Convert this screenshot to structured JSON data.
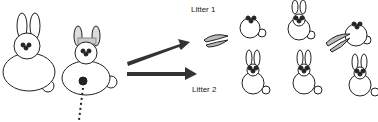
{
  "diagram": {
    "labels": {
      "litter1": "Litter 1",
      "litter2": "Litter 2"
    },
    "parents": [
      {
        "id": "father",
        "accessory": "none"
      },
      {
        "id": "mother",
        "accessory": "bow",
        "marking": "spot"
      }
    ],
    "litters": [
      {
        "name": "Litter 1",
        "offspring": [
          "no-ears",
          "upright-ears",
          "no-ears"
        ],
        "dropped_ears": 2
      },
      {
        "name": "Litter 2",
        "offspring": [
          "upright-ears",
          "upright-ears",
          "upright-ears"
        ]
      }
    ],
    "colors": {
      "line": "#222222",
      "arrow": "#333333",
      "bow": "#cccccc"
    }
  }
}
